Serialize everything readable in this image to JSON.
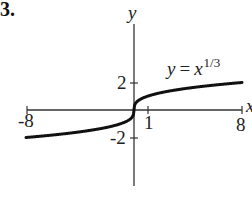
{
  "figure": {
    "panel_label": "3."
  },
  "chart_data": {
    "type": "line",
    "title": "",
    "equation": {
      "lhs": "y",
      "op": "=",
      "base": "x",
      "exponent": "1/3"
    },
    "xlabel": "x",
    "ylabel": "y",
    "xlim": [
      -8,
      8
    ],
    "ylim": [
      -5.5,
      6
    ],
    "x_ticks": [
      {
        "value": -8,
        "label": "-8"
      },
      {
        "value": 1,
        "label": "1"
      },
      {
        "value": 8,
        "label": "8"
      }
    ],
    "y_ticks": [
      {
        "value": 2,
        "label": "2"
      },
      {
        "value": -2,
        "label": "-2"
      }
    ],
    "grid": false,
    "series": [
      {
        "name": "y = x^(1/3)",
        "color": "#111111",
        "x": [
          -8,
          -6,
          -4,
          -2,
          -1,
          -0.5,
          -0.125,
          0,
          0.125,
          0.5,
          1,
          2,
          4,
          6,
          8
        ],
        "y": [
          -2,
          -1.817,
          -1.587,
          -1.26,
          -1,
          -0.794,
          -0.5,
          0,
          0.5,
          0.794,
          1,
          1.26,
          1.587,
          1.817,
          2
        ]
      }
    ]
  }
}
